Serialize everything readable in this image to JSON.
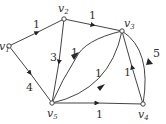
{
  "diagram": {
    "type": "weighted directed graph",
    "nodes": [
      {
        "id": "v1",
        "label": "v",
        "sub": "1",
        "x": 9,
        "y": 46
      },
      {
        "id": "v2",
        "label": "v",
        "sub": "2",
        "x": 64,
        "y": 19
      },
      {
        "id": "v3",
        "label": "v",
        "sub": "3",
        "x": 122,
        "y": 31
      },
      {
        "id": "v4",
        "label": "v",
        "sub": "4",
        "x": 143,
        "y": 104
      },
      {
        "id": "v5",
        "label": "v",
        "sub": "5",
        "x": 52,
        "y": 103
      }
    ],
    "edges": [
      {
        "from": "v1",
        "to": "v2",
        "weight": "1"
      },
      {
        "from": "v2",
        "to": "v3",
        "weight": "1"
      },
      {
        "from": "v2",
        "to": "v5",
        "weight": "3"
      },
      {
        "from": "v1",
        "to": "v5",
        "weight": "4"
      },
      {
        "from": "v3",
        "to": "v5",
        "weight": "1",
        "curved": true
      },
      {
        "from": "v5",
        "to": "v3",
        "weight": "1",
        "curved": true
      },
      {
        "from": "v3",
        "to": "v4",
        "weight": "5",
        "curved": true
      },
      {
        "from": "v4",
        "to": "v3",
        "weight": "1"
      },
      {
        "from": "v5",
        "to": "v4",
        "weight": "1"
      }
    ]
  }
}
